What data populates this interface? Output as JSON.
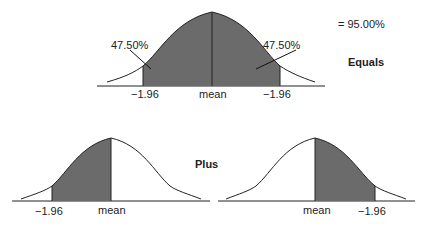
{
  "top": {
    "left_pct": "47.50%",
    "right_pct": "47.50%",
    "ticks": [
      "−1.96",
      "mean",
      "−1.96"
    ],
    "total": "= 95.00%",
    "operator": "Equals"
  },
  "bottom_left": {
    "ticks": [
      "−1.96",
      "mean"
    ]
  },
  "bottom_right": {
    "ticks": [
      "mean",
      "−1.96"
    ]
  },
  "middle_operator": "Plus",
  "colors": {
    "shade": "#6b6b6b",
    "line": "#222222"
  }
}
